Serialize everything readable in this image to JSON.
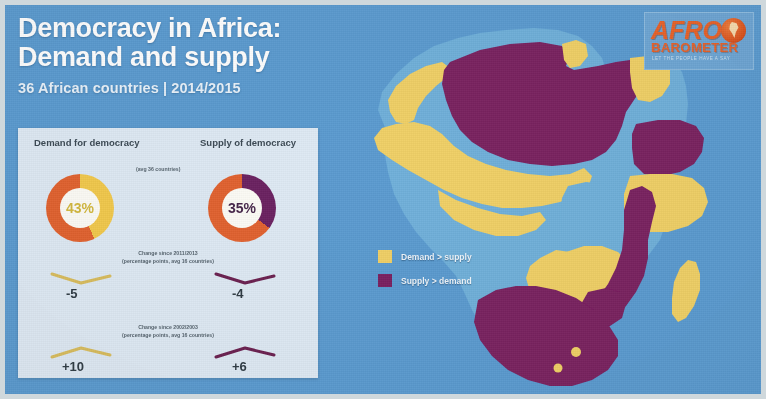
{
  "header": {
    "title_line1": "Democracy in Africa:",
    "title_line2": "Demand and supply",
    "subtitle": "36 African countries  |  2014/2015"
  },
  "logo": {
    "word_top": "AFRO",
    "word_bottom": "BAROMETER",
    "tagline": "LET THE PEOPLE HAVE A SAY",
    "globe_icon": "africa-globe-icon",
    "brand_color": "#e8622a"
  },
  "panel": {
    "demand_heading": "Demand for democracy",
    "supply_heading": "Supply of democracy",
    "avg_note": "(avg 36 countries)",
    "demand": {
      "value_label": "43%",
      "value": 43,
      "ring_color": "#f2c94c",
      "track_color": "#e2622f"
    },
    "supply": {
      "value_label": "35%",
      "value": 35,
      "ring_color": "#6b2161",
      "track_color": "#e2622f"
    },
    "change_blocks": [
      {
        "note_line1": "Change since 2011/2013",
        "note_line2": "(percentage points, avg 16 countries)",
        "demand_delta": "-5",
        "supply_delta": "-4",
        "trend": "down"
      },
      {
        "note_line1": "Change since 2002/2003",
        "note_line2": "(percentage points, avg 16 countries)",
        "demand_delta": "+10",
        "supply_delta": "+6",
        "trend": "up"
      }
    ]
  },
  "legend": {
    "items": [
      {
        "label": "Demand > supply",
        "color": "#f0d066"
      },
      {
        "label": "Supply > demand",
        "color": "#7a2060"
      }
    ]
  },
  "map": {
    "ocean_color": "#5b9bd0",
    "unsurveyed_color": "#6fb0da",
    "demand_color": "#f0d066",
    "supply_color": "#7a2060"
  }
}
